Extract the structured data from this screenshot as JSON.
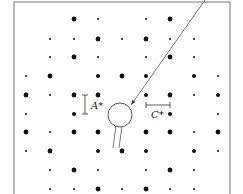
{
  "figure": {
    "title": "",
    "frame": {
      "x": 14,
      "y": 2,
      "width": 216,
      "height": 196,
      "stroke": "#777777"
    },
    "grid": {
      "columns_x": [
        26,
        50,
        74,
        98,
        122,
        146,
        170,
        194,
        218
      ],
      "rows_y": [
        19,
        39,
        57,
        76,
        95,
        114,
        132,
        151,
        170,
        189
      ]
    },
    "dot_radius": {
      "L": 2.4,
      "M": 2.0,
      "s": 1.0
    },
    "dot_color": "#111111",
    "spots": [
      {
        "row": 0,
        "cols": [
          [
            2,
            "L"
          ],
          [
            3,
            "s"
          ],
          [
            5,
            "s"
          ],
          [
            6,
            "L"
          ]
        ]
      },
      {
        "row": 1,
        "cols": [
          [
            1,
            "s"
          ],
          [
            2,
            "s"
          ],
          [
            3,
            "L"
          ],
          [
            4,
            "s"
          ],
          [
            5,
            "L"
          ],
          [
            6,
            "s"
          ],
          [
            7,
            "s"
          ]
        ]
      },
      {
        "row": 2,
        "cols": [
          [
            1,
            "s"
          ],
          [
            2,
            "L"
          ],
          [
            3,
            "s"
          ],
          [
            5,
            "s"
          ],
          [
            6,
            "L"
          ],
          [
            7,
            "s"
          ]
        ]
      },
      {
        "row": 3,
        "cols": [
          [
            0,
            "s"
          ],
          [
            1,
            "L"
          ],
          [
            3,
            "M"
          ],
          [
            4,
            "L"
          ],
          [
            5,
            "M"
          ],
          [
            7,
            "M"
          ],
          [
            8,
            "s"
          ]
        ]
      },
      {
        "row": 4,
        "cols": [
          [
            0,
            "L"
          ],
          [
            1,
            "s"
          ],
          [
            2,
            "L"
          ],
          [
            3,
            "L"
          ],
          [
            5,
            "M"
          ],
          [
            6,
            "L"
          ],
          [
            7,
            "s"
          ],
          [
            8,
            "M"
          ]
        ]
      },
      {
        "row": 5,
        "cols": [
          [
            0,
            "s"
          ],
          [
            2,
            "M"
          ],
          [
            6,
            "M"
          ],
          [
            8,
            "s"
          ]
        ]
      },
      {
        "row": 6,
        "cols": [
          [
            0,
            "L"
          ],
          [
            1,
            "s"
          ],
          [
            2,
            "L"
          ],
          [
            3,
            "L"
          ],
          [
            5,
            "L"
          ],
          [
            6,
            "L"
          ],
          [
            7,
            "s"
          ],
          [
            8,
            "L"
          ]
        ]
      },
      {
        "row": 7,
        "cols": [
          [
            0,
            "s"
          ],
          [
            1,
            "L"
          ],
          [
            3,
            "M"
          ],
          [
            4,
            "L"
          ],
          [
            5,
            "M"
          ],
          [
            7,
            "M"
          ],
          [
            8,
            "s"
          ]
        ]
      },
      {
        "row": 8,
        "cols": [
          [
            1,
            "s"
          ],
          [
            2,
            "L"
          ],
          [
            3,
            "s"
          ],
          [
            5,
            "s"
          ],
          [
            6,
            "L"
          ],
          [
            7,
            "s"
          ]
        ]
      },
      {
        "row": 9,
        "cols": [
          [
            1,
            "s"
          ],
          [
            2,
            "s"
          ],
          [
            3,
            "L"
          ],
          [
            4,
            "s"
          ],
          [
            5,
            "L"
          ],
          [
            6,
            "s"
          ],
          [
            7,
            "s"
          ]
        ]
      }
    ],
    "beam_stop": {
      "cx": 120,
      "cy": 115,
      "r": 12,
      "stem_left": [
        116,
        126,
        113,
        148
      ],
      "stem_right": [
        122,
        126,
        119,
        148
      ]
    },
    "pointer_line": {
      "x1": 205,
      "y1": 0,
      "x2": 131,
      "y2": 105
    },
    "labels": {
      "a_star": {
        "text": "A*",
        "x": 91,
        "y": 109,
        "marker": {
          "x": 85,
          "y1": 95,
          "y2": 114
        }
      },
      "c_star": {
        "text": "C*",
        "x": 151,
        "y": 118,
        "marker": {
          "y": 105,
          "x1": 146,
          "x2": 170
        }
      }
    }
  }
}
